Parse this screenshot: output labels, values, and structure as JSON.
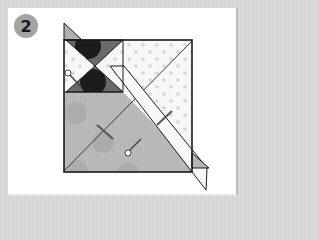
{
  "step": {
    "number": "2",
    "badge_color": "#a3a3a3"
  },
  "diagram": {
    "colors": {
      "paper_light": "#f4f4f4",
      "paper_gray": "#b8b8b8",
      "dark_triangle": "#6a6a6a",
      "circle_dark": "#1c1c1c",
      "circle_light": "#a8a8a8",
      "dot": "#d6d6d6",
      "outline": "#1a1a1a"
    }
  }
}
